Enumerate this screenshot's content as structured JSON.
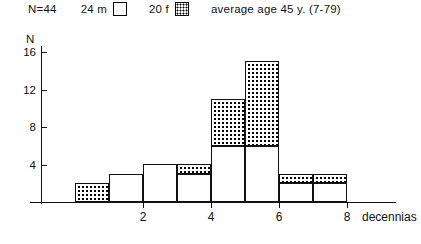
{
  "legend": {
    "total_label": "N=44",
    "male_label": "24 m",
    "male_swatch": "empty-box",
    "female_label": "20 f",
    "female_swatch": "dotted-box",
    "average_label": "average age 45 y. (7-79)"
  },
  "axes": {
    "y_axis_title": "N",
    "y_ticks": [
      "16",
      "12",
      "8",
      "4"
    ],
    "x_ticks": [
      "2",
      "4",
      "6",
      "8"
    ],
    "x_unit_label": "decennias"
  },
  "chart_data": {
    "type": "bar",
    "title": "",
    "subtitle": "",
    "xlabel": "decennias",
    "ylabel": "N",
    "xlim": [
      0,
      9
    ],
    "ylim": [
      0,
      17
    ],
    "ytick_values": [
      4,
      8,
      12,
      16
    ],
    "xtick_values": [
      2,
      4,
      6,
      8
    ],
    "grid": false,
    "legend_position": "top",
    "stacked": true,
    "categories": [
      1,
      2,
      3,
      4,
      5,
      6,
      7,
      8
    ],
    "series": [
      {
        "name": "24 m",
        "fill": "white",
        "values": [
          0,
          3,
          4,
          3,
          6,
          6,
          2,
          2
        ]
      },
      {
        "name": "20 f",
        "fill": "dotted",
        "values": [
          2,
          0,
          0,
          1,
          5,
          9,
          1,
          1
        ]
      }
    ],
    "totals": [
      2,
      3,
      4,
      4,
      11,
      15,
      3,
      3
    ],
    "annotations": [
      "N=44",
      "average age 45 y. (7-79)"
    ]
  },
  "colors": {
    "axis": "#111111",
    "bar_outline": "#111111",
    "male_fill": "#ffffff",
    "female_fill": "#ffffff"
  }
}
